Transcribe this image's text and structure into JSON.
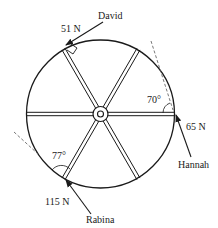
{
  "diagram": {
    "type": "wheel-forces",
    "wheel": {
      "spokes": 6,
      "hub": true
    },
    "forces": [
      {
        "person": "David",
        "magnitude": "51 N",
        "note": "applied tangentially at the top-left spoke rim point (right-angle marker)"
      },
      {
        "person": "Hannah",
        "magnitude": "65 N",
        "angle_label": "70°",
        "note": "applied at the right rim point"
      },
      {
        "person": "Rabina",
        "magnitude": "115 N",
        "angle_label": "77°",
        "note": "applied at the lower-left spoke rim point"
      }
    ],
    "labels": {
      "david_name": "David",
      "david_force": "51 N",
      "hannah_name": "Hannah",
      "hannah_force": "65 N",
      "hannah_angle": "70°",
      "rabina_name": "Rabina",
      "rabina_force": "115 N",
      "rabina_angle": "77°"
    },
    "colors": {
      "ink": "#1a1a1a",
      "background": "#ffffff"
    }
  }
}
